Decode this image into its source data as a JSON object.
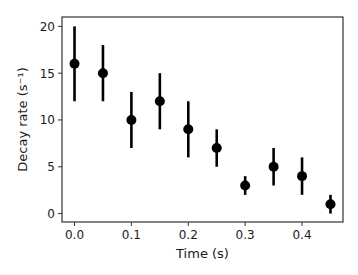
{
  "chart_data": {
    "type": "scatter",
    "title": "",
    "xlabel": "Time (s)",
    "ylabel": "Decay rate (s⁻¹)",
    "xlim": [
      -0.022,
      0.472
    ],
    "ylim": [
      -0.9,
      21
    ],
    "grid": false,
    "legend": null,
    "x_ticks": [
      0.0,
      0.1,
      0.2,
      0.3,
      0.4
    ],
    "x_tick_labels": [
      "0.0",
      "0.1",
      "0.2",
      "0.3",
      "0.4"
    ],
    "y_ticks": [
      0,
      5,
      10,
      15,
      20
    ],
    "y_tick_labels": [
      "0",
      "5",
      "10",
      "15",
      "20"
    ],
    "series": [
      {
        "name": "Decay rate",
        "color": "#000000",
        "marker": "circle",
        "x": [
          0.0,
          0.05,
          0.1,
          0.15,
          0.2,
          0.25,
          0.3,
          0.35,
          0.4,
          0.45
        ],
        "y": [
          16,
          15,
          10,
          12,
          9,
          7,
          3,
          5,
          4,
          1
        ],
        "yerr": [
          4,
          3,
          3,
          3,
          3,
          2,
          1,
          2,
          2,
          1
        ]
      }
    ]
  }
}
